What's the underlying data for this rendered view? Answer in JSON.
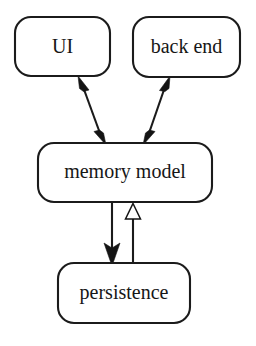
{
  "diagram": {
    "background_color": "#ffffff",
    "stroke_color": "#1b1b1b",
    "text_color": "#161616",
    "nodes": [
      {
        "id": "ui",
        "label": "UI",
        "x": 15,
        "y": 17,
        "width": 95,
        "height": 59,
        "corner_radius": 16,
        "font_size": 20
      },
      {
        "id": "back_end",
        "label": "back end",
        "x": 133,
        "y": 17,
        "width": 107,
        "height": 60,
        "corner_radius": 16,
        "font_size": 20
      },
      {
        "id": "memory_model",
        "label": "memory model",
        "x": 38,
        "y": 143,
        "width": 174,
        "height": 59,
        "corner_radius": 16,
        "font_size": 20
      },
      {
        "id": "persistence",
        "label": "persistence",
        "x": 58,
        "y": 263,
        "width": 132,
        "height": 60,
        "corner_radius": 16,
        "font_size": 20
      }
    ],
    "edges": [
      {
        "id": "ui-memory-model",
        "from": "memory_model",
        "to": "ui",
        "arrow_style": "double-solid",
        "description": "bidirectional arrow between UI and memory model"
      },
      {
        "id": "back-end-memory-model",
        "from": "memory_model",
        "to": "back_end",
        "arrow_style": "double-solid",
        "description": "bidirectional arrow between back end and memory model"
      },
      {
        "id": "memory-model-to-persistence",
        "from": "memory_model",
        "to": "persistence",
        "arrow_style": "solid-filled",
        "description": "solid filled arrow from memory model down to persistence"
      },
      {
        "id": "persistence-to-memory-model",
        "from": "persistence",
        "to": "memory_model",
        "arrow_style": "hollow-triangle",
        "description": "hollow triangle arrow from persistence up to memory model"
      }
    ]
  }
}
